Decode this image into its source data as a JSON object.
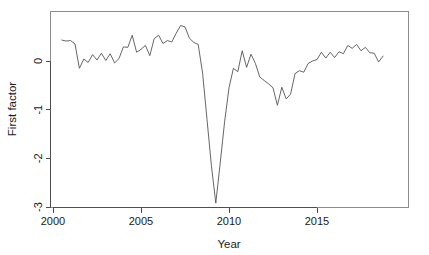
{
  "chart_data": {
    "type": "line",
    "title": "",
    "subtitle": "",
    "xlabel": "Year",
    "ylabel": "First factor",
    "xlim": [
      2000.0,
      2020.2
    ],
    "ylim": [
      -3.0,
      0.88
    ],
    "grid": false,
    "legend": "none",
    "xticks": [
      2000,
      2005,
      2010,
      2015
    ],
    "xtick_labels": [
      "2000",
      "2005",
      "2010",
      "2015"
    ],
    "yticks": [
      0,
      -1,
      -2,
      -3
    ],
    "ytick_labels": [
      "0",
      "-1",
      "-2",
      "-3"
    ],
    "line_color": "#555555",
    "axis_color": "#4d4d4d",
    "frame_color": "#8c8c8c",
    "background_color": "#ffffff",
    "series": [
      {
        "name": "First factor",
        "x": [
          2000.5,
          2000.75,
          2001.0,
          2001.25,
          2001.5,
          2001.75,
          2002.0,
          2002.25,
          2002.5,
          2002.75,
          2003.0,
          2003.25,
          2003.5,
          2003.75,
          2004.0,
          2004.25,
          2004.5,
          2004.75,
          2005.0,
          2005.25,
          2005.5,
          2005.75,
          2006.0,
          2006.25,
          2006.5,
          2006.75,
          2007.0,
          2007.25,
          2007.5,
          2007.75,
          2008.0,
          2008.25,
          2008.5,
          2008.75,
          2009.0,
          2009.25,
          2009.5,
          2009.75,
          2010.0,
          2010.25,
          2010.5,
          2010.75,
          2011.0,
          2011.25,
          2011.5,
          2011.75,
          2012.0,
          2012.25,
          2012.5,
          2012.75,
          2013.0,
          2013.25,
          2013.5,
          2013.75,
          2014.0,
          2014.25,
          2014.5,
          2014.75,
          2015.0,
          2015.25,
          2015.5,
          2015.75,
          2016.0,
          2016.25,
          2016.5,
          2016.75,
          2017.0,
          2017.25,
          2017.5,
          2017.75,
          2018.0,
          2018.25,
          2018.5,
          2018.75
        ],
        "values": [
          0.43,
          0.41,
          0.42,
          0.35,
          -0.15,
          0.04,
          -0.03,
          0.13,
          0.02,
          0.16,
          0.01,
          0.15,
          -0.04,
          0.05,
          0.29,
          0.28,
          0.53,
          0.18,
          0.24,
          0.32,
          0.11,
          0.46,
          0.53,
          0.36,
          0.42,
          0.39,
          0.57,
          0.73,
          0.7,
          0.47,
          0.38,
          0.34,
          -0.25,
          -1.2,
          -2.15,
          -2.92,
          -2.1,
          -1.25,
          -0.55,
          -0.15,
          -0.22,
          0.21,
          -0.13,
          0.14,
          -0.05,
          -0.33,
          -0.4,
          -0.47,
          -0.55,
          -0.91,
          -0.54,
          -0.78,
          -0.68,
          -0.26,
          -0.2,
          -0.23,
          -0.05,
          0.0,
          0.03,
          0.18,
          0.06,
          0.18,
          0.07,
          0.19,
          0.15,
          0.32,
          0.26,
          0.34,
          0.21,
          0.28,
          0.17,
          0.16,
          -0.02,
          0.1
        ]
      }
    ]
  },
  "axes": {
    "x_title": "Year",
    "y_title": "First factor"
  }
}
